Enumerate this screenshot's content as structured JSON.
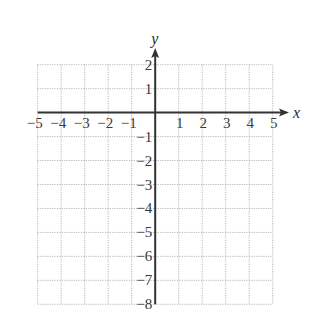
{
  "chart_data": {
    "type": "scatter",
    "title": "",
    "xlabel": "x",
    "ylabel": "y",
    "xlim": [
      -5,
      5
    ],
    "ylim": [
      -8,
      2
    ],
    "grid": true,
    "grid_style": "dotted",
    "x_ticks": [
      -5,
      -4,
      -3,
      -2,
      -1,
      1,
      2,
      3,
      4,
      5
    ],
    "x_tick_labels": [
      "−5",
      "−4",
      "−3",
      "−2",
      "−1",
      "1",
      "2",
      "3",
      "4",
      "5"
    ],
    "y_ticks": [
      2,
      1,
      -1,
      -2,
      -3,
      -4,
      -5,
      -6,
      -7,
      -8
    ],
    "y_tick_labels": [
      "2",
      "1",
      "−1",
      "−2",
      "−3",
      "−4",
      "−5",
      "−6",
      "−7",
      "−8"
    ],
    "series": [],
    "legend": null
  },
  "colors": {
    "grid": "#b8b8b8",
    "axis": "#333333",
    "text": "#3a3a3a"
  }
}
